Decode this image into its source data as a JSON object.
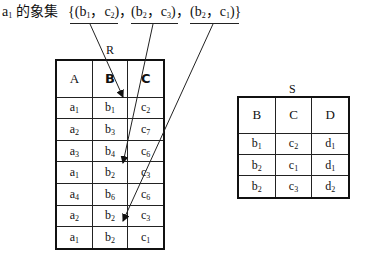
{
  "header": {
    "prefix_base": "a",
    "prefix_sub": "1",
    "prefix_text": " 的象集",
    "set": [
      {
        "open": "{(",
        "b": "b",
        "b_sub": "1",
        "sep": "，",
        "c": "c",
        "c_sub": "2",
        "close": ")，"
      },
      {
        "open": "(",
        "b": "b",
        "b_sub": "2",
        "sep": "，",
        "c": "c",
        "c_sub": "3",
        "close": ")，"
      },
      {
        "open": "(",
        "b": "b",
        "b_sub": "2",
        "sep": "，",
        "c": "c",
        "c_sub": "1",
        "close": ")}"
      }
    ]
  },
  "table_R": {
    "label": "R",
    "columns": [
      "A",
      "B",
      "C"
    ],
    "rows": [
      [
        {
          "v": "a",
          "s": "1"
        },
        {
          "v": "b",
          "s": "1"
        },
        {
          "v": "c",
          "s": "2"
        }
      ],
      [
        {
          "v": "a",
          "s": "2"
        },
        {
          "v": "b",
          "s": "3"
        },
        {
          "v": "c",
          "s": "7"
        }
      ],
      [
        {
          "v": "a",
          "s": "3"
        },
        {
          "v": "b",
          "s": "4"
        },
        {
          "v": "c",
          "s": "6"
        }
      ],
      [
        {
          "v": "a",
          "s": "1"
        },
        {
          "v": "b",
          "s": "2"
        },
        {
          "v": "c",
          "s": "3"
        }
      ],
      [
        {
          "v": "a",
          "s": "4"
        },
        {
          "v": "b",
          "s": "6"
        },
        {
          "v": "c",
          "s": "6"
        }
      ],
      [
        {
          "v": "a",
          "s": "2"
        },
        {
          "v": "b",
          "s": "2"
        },
        {
          "v": "c",
          "s": "3"
        }
      ],
      [
        {
          "v": "a",
          "s": "1"
        },
        {
          "v": "b",
          "s": "2"
        },
        {
          "v": "c",
          "s": "1"
        }
      ]
    ]
  },
  "table_S": {
    "label": "S",
    "columns": [
      "B",
      "C",
      "D"
    ],
    "rows": [
      [
        {
          "v": "b",
          "s": "1"
        },
        {
          "v": "c",
          "s": "2"
        },
        {
          "v": "d",
          "s": "1"
        }
      ],
      [
        {
          "v": "b",
          "s": "2"
        },
        {
          "v": "c",
          "s": "1"
        },
        {
          "v": "d",
          "s": "1"
        }
      ],
      [
        {
          "v": "b",
          "s": "2"
        },
        {
          "v": "c",
          "s": "3"
        },
        {
          "v": "d",
          "s": "2"
        }
      ]
    ]
  },
  "arrows": [
    {
      "from": "(b1, c2)",
      "to_row": 1
    },
    {
      "from": "(b2, c3)",
      "to_row": 4
    },
    {
      "from": "(b2, c1)",
      "to_row": 7
    }
  ]
}
